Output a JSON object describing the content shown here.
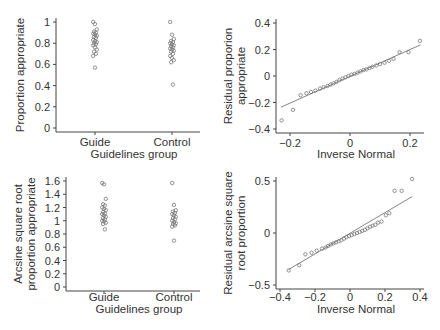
{
  "chart_data": [
    {
      "id": "tl",
      "type": "scatter",
      "subtype": "strip",
      "title": "",
      "xlabel": "Guidelines group",
      "ylabel": [
        "Proportion appropriate"
      ],
      "categories": [
        "Guide",
        "Control"
      ],
      "ylim": [
        0,
        1
      ],
      "yticks": [
        0,
        0.2,
        0.4,
        0.6,
        0.8,
        1
      ],
      "ytick_labels": [
        "0",
        "0.2",
        "0.4",
        "0.6",
        "0.8",
        "1"
      ],
      "grid": false,
      "series": [
        {
          "name": "Guide",
          "values": [
            1.0,
            0.98,
            0.93,
            0.91,
            0.9,
            0.89,
            0.88,
            0.87,
            0.86,
            0.85,
            0.83,
            0.82,
            0.81,
            0.8,
            0.79,
            0.78,
            0.76,
            0.74,
            0.72,
            0.7,
            0.68,
            0.57
          ]
        },
        {
          "name": "Control",
          "values": [
            1.0,
            0.88,
            0.84,
            0.82,
            0.81,
            0.8,
            0.79,
            0.78,
            0.77,
            0.76,
            0.75,
            0.74,
            0.73,
            0.72,
            0.7,
            0.68,
            0.66,
            0.64,
            0.62,
            0.41
          ]
        }
      ]
    },
    {
      "id": "tr",
      "type": "scatter",
      "subtype": "qq",
      "title": "",
      "xlabel": "Inverse  Normal",
      "ylabel": [
        "Residual proporion",
        "appropriate"
      ],
      "xlim": [
        -0.24,
        0.24
      ],
      "ylim": [
        -0.4,
        0.4
      ],
      "xticks": [
        -0.2,
        0,
        0.2
      ],
      "xtick_labels": [
        "−0.2",
        "0",
        "0.2"
      ],
      "yticks": [
        -0.4,
        -0.2,
        0,
        0.2,
        0.4
      ],
      "ytick_labels": [
        "−0.4",
        "−0.2",
        "0",
        "0.2",
        "0.4"
      ],
      "grid": false,
      "fit_line": {
        "x": [
          -0.23,
          0.235
        ],
        "y": [
          -0.235,
          0.235
        ]
      },
      "points": {
        "x": [
          -0.228,
          -0.19,
          -0.165,
          -0.145,
          -0.13,
          -0.115,
          -0.1,
          -0.088,
          -0.075,
          -0.065,
          -0.055,
          -0.045,
          -0.035,
          -0.025,
          -0.015,
          -0.005,
          0.005,
          0.015,
          0.025,
          0.035,
          0.045,
          0.055,
          0.065,
          0.075,
          0.088,
          0.1,
          0.115,
          0.13,
          0.145,
          0.165,
          0.195,
          0.233
        ],
        "y": [
          -0.335,
          -0.255,
          -0.145,
          -0.13,
          -0.12,
          -0.11,
          -0.095,
          -0.085,
          -0.075,
          -0.065,
          -0.055,
          -0.045,
          -0.03,
          -0.02,
          -0.01,
          0.0,
          0.01,
          0.015,
          0.025,
          0.035,
          0.045,
          0.05,
          0.06,
          0.07,
          0.08,
          0.09,
          0.1,
          0.115,
          0.13,
          0.18,
          0.18,
          0.265
        ]
      }
    },
    {
      "id": "bl",
      "type": "scatter",
      "subtype": "strip",
      "title": "",
      "xlabel": "Guidelines group",
      "ylabel": [
        "Arcsine square root",
        "proportion appropriate"
      ],
      "categories": [
        "Guide",
        "Control"
      ],
      "ylim": [
        0,
        1.6
      ],
      "yticks": [
        0,
        0.2,
        0.4,
        0.6,
        0.8,
        1,
        1.2,
        1.4,
        1.6
      ],
      "ytick_labels": [
        "0",
        "0.2",
        "0.4",
        "0.6",
        "0.8",
        "1",
        "1.2",
        "1.4",
        "1.6"
      ],
      "grid": false,
      "series": [
        {
          "name": "Guide",
          "values": [
            1.57,
            1.55,
            1.33,
            1.25,
            1.23,
            1.2,
            1.18,
            1.16,
            1.13,
            1.11,
            1.1,
            1.08,
            1.06,
            1.04,
            1.02,
            1.0,
            0.99,
            0.97,
            0.95,
            0.87
          ]
        },
        {
          "name": "Control",
          "values": [
            1.57,
            1.24,
            1.16,
            1.14,
            1.12,
            1.1,
            1.08,
            1.06,
            1.04,
            1.02,
            1.0,
            0.98,
            0.96,
            0.95,
            0.93,
            0.91,
            0.7
          ]
        }
      ]
    },
    {
      "id": "br",
      "type": "scatter",
      "subtype": "qq",
      "title": "",
      "xlabel": "Inverse  Normal",
      "ylabel": [
        "Residual arcsine square",
        "root proportion"
      ],
      "xlim": [
        -0.4,
        0.4
      ],
      "ylim": [
        -0.5,
        0.5
      ],
      "xticks": [
        -0.4,
        -0.2,
        0,
        0.2,
        0.4
      ],
      "xtick_labels": [
        "−0.4",
        "−0.2",
        "0",
        "0.2",
        "0.4"
      ],
      "yticks": [
        -0.5,
        0,
        0.5
      ],
      "ytick_labels": [
        "−0.5",
        "0",
        "0.5"
      ],
      "grid": false,
      "fit_line": {
        "x": [
          -0.35,
          0.355
        ],
        "y": [
          -0.35,
          0.35
        ]
      },
      "points": {
        "x": [
          -0.35,
          -0.29,
          -0.255,
          -0.22,
          -0.19,
          -0.16,
          -0.14,
          -0.125,
          -0.11,
          -0.095,
          -0.08,
          -0.065,
          -0.05,
          -0.035,
          -0.02,
          -0.005,
          0.01,
          0.025,
          0.04,
          0.055,
          0.07,
          0.085,
          0.1,
          0.115,
          0.13,
          0.145,
          0.16,
          0.18,
          0.205,
          0.225,
          0.255,
          0.295,
          0.355
        ],
        "y": [
          -0.36,
          -0.31,
          -0.205,
          -0.19,
          -0.17,
          -0.15,
          -0.14,
          -0.125,
          -0.11,
          -0.1,
          -0.09,
          -0.08,
          -0.07,
          -0.055,
          -0.04,
          -0.03,
          -0.02,
          -0.01,
          0.0,
          0.01,
          0.02,
          0.03,
          0.045,
          0.06,
          0.07,
          0.08,
          0.1,
          0.11,
          0.17,
          0.19,
          0.405,
          0.405,
          0.52
        ]
      }
    }
  ],
  "layout": {
    "panels": {
      "tl": {
        "plot_left": 56,
        "plot_right": 200,
        "y_top": 22,
        "y_bottom": 128,
        "cat_x": [
          95,
          172
        ],
        "xlabel_y": 158,
        "catlabel_y": 146,
        "ylabel_x": 24
      },
      "tr": {
        "plot_left": 276,
        "plot_right": 424,
        "y_top": 23,
        "y_bottom": 129,
        "x_left": 290,
        "x_right": 410,
        "xlabel_y": 158,
        "xticklabel_y": 147,
        "ylabel_x": 232
      },
      "bl": {
        "plot_left": 66,
        "plot_right": 200,
        "y_top": 181,
        "y_bottom": 287,
        "cat_x": [
          104,
          174
        ],
        "xlabel_y": 313,
        "catlabel_y": 301,
        "ylabel_x": 22
      },
      "br": {
        "plot_left": 276,
        "plot_right": 424,
        "y_top": 181,
        "y_bottom": 285,
        "x_left": 280,
        "x_right": 420,
        "xlabel_y": 313,
        "xticklabel_y": 301,
        "ylabel_x": 232
      }
    },
    "colors": {
      "axis": "#444444",
      "marker": "#777777",
      "line": "#666666",
      "text": "#333333"
    }
  }
}
